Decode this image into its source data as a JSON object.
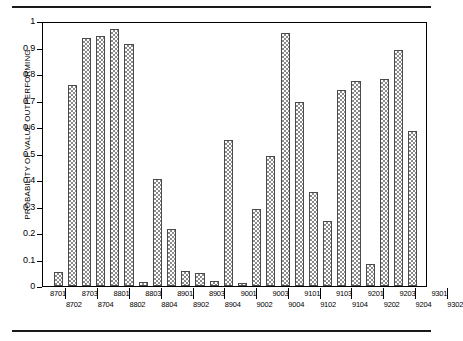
{
  "figure": {
    "top_rule": "horizontal-rule",
    "bottom_rule": "horizontal-rule"
  },
  "axis": {
    "y_title": "PROBABILITY OF VALUE OUTPERFORMING",
    "y_ticks": [
      "0",
      "0.1",
      "0.2",
      "0.3",
      "0.4",
      "0.5",
      "0.6",
      "0.7",
      "0.8",
      "0.9",
      "1"
    ]
  },
  "chart_data": {
    "type": "bar",
    "title": "",
    "xlabel": "",
    "ylabel": "PROBABILITY OF VALUE OUTPERFORMING",
    "ylim": [
      0,
      1
    ],
    "yticks": [
      0,
      0.1,
      0.2,
      0.3,
      0.4,
      0.5,
      0.6,
      0.7,
      0.8,
      0.9,
      1
    ],
    "grid": false,
    "legend": "none",
    "categories": [
      "8701",
      "8702",
      "8703",
      "8704",
      "8801",
      "8802",
      "8803",
      "8804",
      "8901",
      "8902",
      "8903",
      "8904",
      "9001",
      "9002",
      "9003",
      "9004",
      "9101",
      "9102",
      "9103",
      "9104",
      "9201",
      "9202",
      "9203",
      "9204",
      "9301",
      "9302"
    ],
    "values": [
      0.055,
      0.765,
      0.942,
      0.952,
      0.978,
      0.92,
      0.015,
      0.408,
      0.218,
      0.058,
      0.05,
      0.02,
      0.557,
      0.012,
      0.293,
      0.494,
      0.961,
      0.699,
      0.356,
      0.249,
      0.745,
      0.779,
      0.082,
      0.786,
      0.899,
      0.59
    ]
  }
}
